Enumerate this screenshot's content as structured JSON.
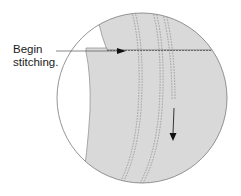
{
  "diagram": {
    "callout_label_line1": "Begin",
    "callout_label_line2": "stitching.",
    "colors": {
      "fabric": "#d9d9d9",
      "outline": "#7a7a7a",
      "stitch": "#8a8a8a",
      "arrow": "#111111",
      "background": "#ffffff"
    },
    "elements": [
      "magnified-circle",
      "upper-fabric-layer",
      "lower-fabric-layer",
      "horizontal-seam-stitching",
      "curved-stitch-rows",
      "stitch-direction-arrow-right",
      "stitch-direction-arrow-down",
      "callout-leader-line"
    ]
  }
}
